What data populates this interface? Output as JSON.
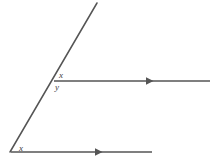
{
  "figure": {
    "type": "geometry-diagram",
    "width": 222,
    "height": 158,
    "background_color": "#ffffff",
    "stroke_color": "#555555",
    "stroke_width": 1.5,
    "label_color": "#3d3d3d",
    "elements": {
      "transversal_ray": {
        "name": "diagonal-ray",
        "from": [
          10,
          152
        ],
        "to": [
          97,
          3
        ]
      },
      "upper_ray": {
        "name": "upper-horizontal-ray",
        "from": [
          54,
          81
        ],
        "to": [
          210,
          81
        ],
        "arrow_marker_x": 150,
        "arrow_direction": "right"
      },
      "lower_ray": {
        "name": "lower-horizontal-ray",
        "from": [
          11,
          152
        ],
        "to": [
          152,
          152
        ],
        "arrow_marker_x": 99,
        "arrow_direction": "right"
      },
      "vertices": {
        "upper_intersection": [
          54,
          81
        ],
        "lower_vertex": [
          10,
          152
        ]
      }
    },
    "labels": {
      "x_upper": "x",
      "y_upper": "y",
      "x_lower": "x"
    }
  }
}
